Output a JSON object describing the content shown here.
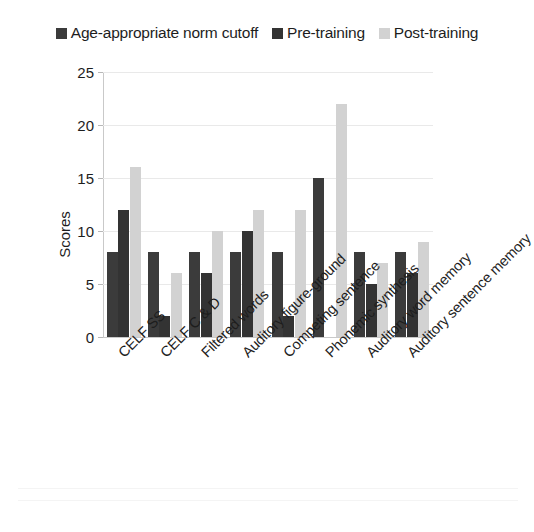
{
  "chart_data": {
    "type": "bar",
    "title": "",
    "xlabel": "",
    "ylabel": "Scores",
    "ylim": [
      0,
      25
    ],
    "yticks": [
      0,
      5,
      10,
      15,
      20,
      25
    ],
    "grid": true,
    "legend_position": "top",
    "categories": [
      "CELF SS",
      "CELF C & D",
      "Filtered words",
      "Auditory figure-ground",
      "Competing sentence",
      "Phonemic synthesis",
      "Auditory word memory",
      "Auditory sentence memory"
    ],
    "series": [
      {
        "name": "Age-appropriate norm cutoff",
        "color": "#3b3b3b",
        "values": [
          8,
          8,
          8,
          8,
          8,
          15,
          8,
          8
        ]
      },
      {
        "name": "Pre-training",
        "color": "#333333",
        "values": [
          12,
          2,
          6,
          10,
          2,
          0,
          5,
          6
        ]
      },
      {
        "name": "Post-training",
        "color": "#d2d2d2",
        "values": [
          16,
          6,
          10,
          12,
          12,
          22,
          7,
          9
        ]
      }
    ]
  }
}
